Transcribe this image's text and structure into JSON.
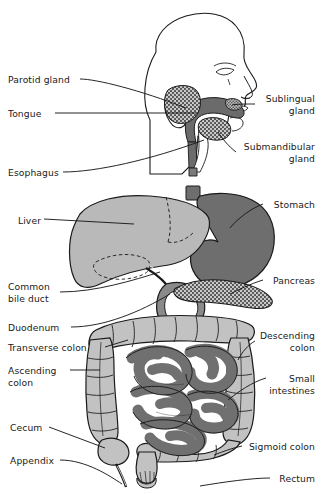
{
  "figure": {
    "background_color": "#ffffff",
    "width": 323,
    "height": 494
  },
  "palette": {
    "outline": "#1a1a1a",
    "text": "#1a1a1a",
    "liver_fill": "#b9b9b9",
    "stomach_fill": "#6e6e6e",
    "colon_fill": "#c2c2c2",
    "small_intestine_fill": "#707070",
    "gland_fill": "#8d8d8d",
    "pancreas_fill": "#9a9a9a",
    "skin_fill": "#ffffff",
    "esophagus_fill": "#7a7a7a",
    "leader_line": "#1a1a1a"
  },
  "labels": {
    "left": [
      {
        "id": "parotid-gland",
        "text": "Parotid gland",
        "x": 8,
        "y": 74
      },
      {
        "id": "tongue",
        "text": "Tongue",
        "x": 8,
        "y": 108
      },
      {
        "id": "esophagus",
        "text": "Esophagus",
        "x": 8,
        "y": 167
      },
      {
        "id": "liver",
        "text": "Liver",
        "x": 18,
        "y": 215
      },
      {
        "id": "common-bile-duct",
        "text": "Common\nbile duct",
        "x": 8,
        "y": 281
      },
      {
        "id": "duodenum",
        "text": "Duodenum",
        "x": 8,
        "y": 322
      },
      {
        "id": "transverse-colon",
        "text": "Transverse colon",
        "x": 8,
        "y": 342
      },
      {
        "id": "ascending-colon",
        "text": "Ascending\ncolon",
        "x": 8,
        "y": 365
      },
      {
        "id": "cecum",
        "text": "Cecum",
        "x": 10,
        "y": 422
      },
      {
        "id": "appendix",
        "text": "Appendix",
        "x": 10,
        "y": 455
      }
    ],
    "right": [
      {
        "id": "sublingual-gland",
        "text": "Sublingual\ngland",
        "x": 258,
        "y": 93
      },
      {
        "id": "submandibular-gland",
        "text": "Submandibular\ngland",
        "x": 238,
        "y": 141
      },
      {
        "id": "stomach",
        "text": "Stomach",
        "x": 267,
        "y": 199
      },
      {
        "id": "pancreas",
        "text": "Pancreas",
        "x": 267,
        "y": 275
      },
      {
        "id": "descending-colon",
        "text": "Descending\ncolon",
        "x": 257,
        "y": 330
      },
      {
        "id": "small-intestines",
        "text": "Small\nintestines",
        "x": 270,
        "y": 373
      },
      {
        "id": "sigmoid-colon",
        "text": "Sigmoid colon",
        "x": 245,
        "y": 441
      },
      {
        "id": "rectum",
        "text": "Rectum",
        "x": 273,
        "y": 473
      }
    ]
  },
  "organs": [
    {
      "id": "head-profile",
      "name": "head profile outline"
    },
    {
      "id": "parotid-gland",
      "name": "parotid gland"
    },
    {
      "id": "sublingual-gland",
      "name": "sublingual gland"
    },
    {
      "id": "submandibular-gland",
      "name": "submandibular gland"
    },
    {
      "id": "tongue",
      "name": "tongue and oral cavity"
    },
    {
      "id": "esophagus",
      "name": "esophagus"
    },
    {
      "id": "liver",
      "name": "liver"
    },
    {
      "id": "stomach",
      "name": "stomach"
    },
    {
      "id": "pancreas",
      "name": "pancreas"
    },
    {
      "id": "duodenum",
      "name": "duodenum"
    },
    {
      "id": "common-bile-duct",
      "name": "common bile duct"
    },
    {
      "id": "transverse-colon",
      "name": "transverse colon"
    },
    {
      "id": "ascending-colon",
      "name": "ascending colon"
    },
    {
      "id": "descending-colon",
      "name": "descending colon"
    },
    {
      "id": "small-intestines",
      "name": "small intestines"
    },
    {
      "id": "cecum",
      "name": "cecum"
    },
    {
      "id": "appendix",
      "name": "appendix"
    },
    {
      "id": "sigmoid-colon",
      "name": "sigmoid colon"
    },
    {
      "id": "rectum",
      "name": "rectum"
    }
  ]
}
